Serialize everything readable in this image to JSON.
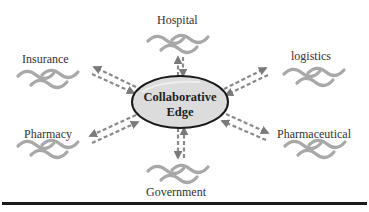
{
  "diagram": {
    "center": {
      "line1": "Collaborative",
      "line2": "Edge"
    },
    "nodes": [
      {
        "id": "hospital",
        "label": "Hospital"
      },
      {
        "id": "insurance",
        "label": "Insurance"
      },
      {
        "id": "logistics",
        "label": "logistics"
      },
      {
        "id": "pharmacy",
        "label": "Pharmacy"
      },
      {
        "id": "pharmaceutical",
        "label": "Pharmaceutical"
      },
      {
        "id": "government",
        "label": "Government"
      }
    ],
    "colors": {
      "ellipse_fill": "#dcdcdc",
      "ellipse_stroke": "#1a1a1a",
      "arrow": "#888888",
      "wave": "#a8a8a8",
      "text": "#333333",
      "rule": "#1a1a1a"
    }
  }
}
